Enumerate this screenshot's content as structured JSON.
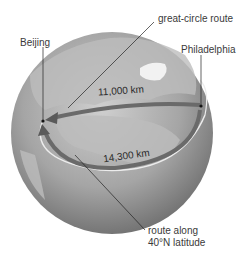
{
  "figure": {
    "labels": {
      "great_circle": "great-circle route",
      "beijing": "Beijing",
      "philadelphia": "Philadelphia",
      "route_along_1": "route along",
      "route_along_2": "40°N latitude"
    },
    "distances": {
      "great_circle": "11,000 km",
      "latitude": "14,300 km"
    }
  },
  "colors": {
    "globe_light": "#c4c4c4",
    "globe_dark": "#6e6e6e",
    "land": "#b0b0b0",
    "arrow": "#6a6a6a",
    "latitude_line": "#e8e8e8",
    "text": "#3a3a3a"
  }
}
